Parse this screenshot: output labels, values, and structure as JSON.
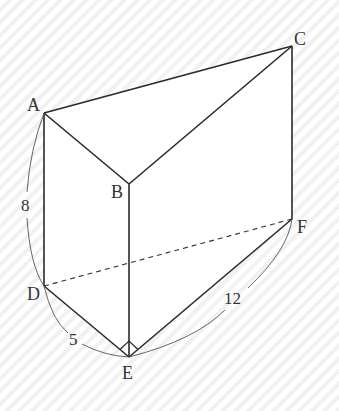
{
  "figure": {
    "type": "triangular-prism",
    "vertices": {
      "A": {
        "label": "A",
        "x": 44,
        "y": 113
      },
      "B": {
        "label": "B",
        "x": 129,
        "y": 184
      },
      "C": {
        "label": "C",
        "x": 292,
        "y": 46
      },
      "D": {
        "label": "D",
        "x": 44,
        "y": 286
      },
      "E": {
        "label": "E",
        "x": 129,
        "y": 357
      },
      "F": {
        "label": "F",
        "x": 292,
        "y": 219
      }
    },
    "measurements": {
      "AD": "8",
      "DE": "5",
      "EF": "12"
    },
    "right_angle_at": "E",
    "hidden_edge": "DF"
  }
}
